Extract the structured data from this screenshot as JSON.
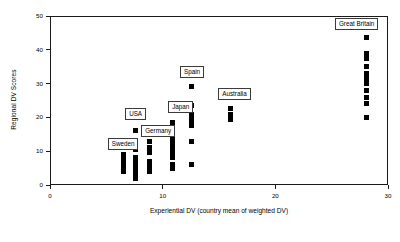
{
  "chart_data": {
    "type": "scatter",
    "title": "",
    "subtitle": "",
    "xlabel": "Experiential DV (country mean of weighted DV)",
    "ylabel": "Regional DV Scores",
    "xlim": [
      0,
      30
    ],
    "ylim": [
      0,
      50
    ],
    "xticks": [
      0,
      10,
      20,
      30
    ],
    "yticks": [
      0,
      10,
      20,
      30,
      40,
      50
    ],
    "xtick_labels": [
      "0",
      "10",
      "20",
      "30"
    ],
    "ytick_labels": [
      "0",
      "10",
      "20",
      "30",
      "40",
      "50"
    ],
    "grid": false,
    "legend": "none",
    "marker": "square",
    "marker_color": "#000000",
    "series": [
      {
        "name": "Sweden",
        "label": "Sweden",
        "x": 6.5,
        "values": [
          4.0,
          5.0,
          6.0,
          7.0,
          8.0,
          9.0
        ]
      },
      {
        "name": "USA",
        "label": "USA",
        "x": 7.6,
        "values": [
          2.0,
          3.0,
          4.0,
          5.0,
          6.0,
          7.0,
          8.0,
          10.5,
          12.0,
          16.0
        ]
      },
      {
        "name": "Germany",
        "label": "Germany",
        "x": 8.8,
        "values": [
          4.0,
          5.0,
          6.0,
          7.0,
          9.5,
          11.0,
          13.0
        ]
      },
      {
        "name": "Japan",
        "label": "Japan",
        "x": 10.9,
        "values": [
          5.0,
          6.0,
          8.0,
          9.0,
          10.0,
          11.0,
          12.0,
          13.0,
          14.0,
          15.0,
          16.0,
          18.5
        ]
      },
      {
        "name": "Spain",
        "label": "Spain",
        "x": 12.6,
        "values": [
          6.0,
          13.0,
          17.5,
          19.0,
          20.0,
          21.0,
          23.5,
          29.0
        ]
      },
      {
        "name": "Australia",
        "label": "Australia",
        "x": 16.0,
        "values": [
          19.5,
          21.0,
          22.5
        ]
      },
      {
        "name": "Great Britain",
        "label": "Great Britain",
        "x": 28.1,
        "values": [
          20.0,
          24.0,
          26.0,
          28.0,
          30.0,
          31.5,
          33.0,
          35.0,
          37.5,
          39.0,
          43.5
        ]
      }
    ],
    "annotations": [
      {
        "text": "Sweden",
        "x": 6.5,
        "y": 12.0
      },
      {
        "text": "USA",
        "x": 7.6,
        "y": 21.0
      },
      {
        "text": "Germany",
        "x": 9.6,
        "y": 16.0
      },
      {
        "text": "Japan",
        "x": 11.6,
        "y": 23.0
      },
      {
        "text": "Spain",
        "x": 12.6,
        "y": 33.5
      },
      {
        "text": "Australia",
        "x": 16.4,
        "y": 27.0
      },
      {
        "text": "Great Britain",
        "x": 27.2,
        "y": 47.5
      }
    ]
  }
}
